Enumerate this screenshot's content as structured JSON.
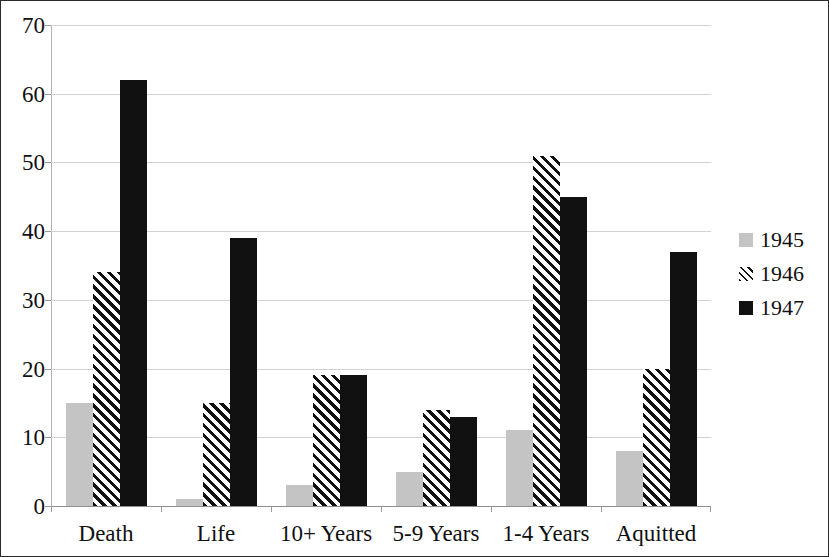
{
  "chart_data": {
    "type": "bar",
    "title": "",
    "subtitle": "",
    "xlabel": "",
    "ylabel": "",
    "categories": [
      "Death",
      "Life",
      "10+ Years",
      "5-9 Years",
      "1-4 Years",
      "Aquitted"
    ],
    "series": [
      {
        "name": "1945",
        "values": [
          15,
          1,
          3,
          5,
          11,
          8
        ],
        "color": "#c4c4c4",
        "fill": "solid-gray"
      },
      {
        "name": "1946",
        "values": [
          34,
          15,
          19,
          14,
          51,
          20
        ],
        "color": "#111111",
        "fill": "diagonal-hatch"
      },
      {
        "name": "1947",
        "values": [
          62,
          39,
          19,
          13,
          45,
          37
        ],
        "color": "#111111",
        "fill": "solid-black"
      }
    ],
    "ylim": [
      0,
      70
    ],
    "yticks": [
      0,
      10,
      20,
      30,
      40,
      50,
      60,
      70
    ],
    "ytick_labels": [
      "0",
      "10",
      "20",
      "30",
      "40",
      "50",
      "60",
      "70"
    ],
    "grid": true,
    "grid_axis": "y",
    "legend_position": "right",
    "legend_entries": [
      "1945",
      "1946",
      "1947"
    ]
  }
}
